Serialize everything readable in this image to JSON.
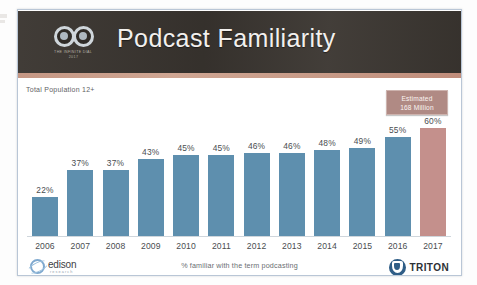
{
  "slide": {
    "title": "Podcast Familiarity",
    "brand": {
      "logo_line1": "THE INFINITE DIAL",
      "logo_line2": "2017"
    },
    "population_note": "Total Population 12+",
    "callout": {
      "line1": "Estimated",
      "line2": "168 Million"
    },
    "footer": {
      "caption": "% familiar with the term podcasting",
      "copyright": "The Infinite Dial  © 2017 Edison Research and Triton Digital",
      "edison_word": "edison",
      "edison_sub": "research",
      "triton_word": "TRITON"
    }
  },
  "colors": {
    "header_background": "#3b3631",
    "header_stripe": "#c79a87",
    "bar_primary": "#5e8fae",
    "bar_accent": "#c4908c",
    "callout_background": "#b08a84",
    "slide_background": "#ffffff",
    "axis_line": "#cfd6dc"
  },
  "chart_data": {
    "type": "bar",
    "title": "Podcast Familiarity",
    "subtitle": "Total Population 12+",
    "xlabel": "",
    "ylabel": "",
    "ylim": [
      0,
      65
    ],
    "grid": false,
    "legend": "none",
    "annotation": "Estimated 168 Million",
    "value_suffix": "%",
    "categories": [
      "2006",
      "2007",
      "2008",
      "2009",
      "2010",
      "2011",
      "2012",
      "2013",
      "2014",
      "2015",
      "2016",
      "2017"
    ],
    "values": [
      22,
      37,
      37,
      43,
      45,
      45,
      46,
      46,
      48,
      49,
      55,
      60
    ],
    "value_labels": [
      "22%",
      "37%",
      "37%",
      "43%",
      "45%",
      "45%",
      "46%",
      "46%",
      "48%",
      "49%",
      "55%",
      "60%"
    ],
    "bar_colors": [
      "#5e8fae",
      "#5e8fae",
      "#5e8fae",
      "#5e8fae",
      "#5e8fae",
      "#5e8fae",
      "#5e8fae",
      "#5e8fae",
      "#5e8fae",
      "#5e8fae",
      "#5e8fae",
      "#c4908c"
    ],
    "footnote": "% familiar with the term podcasting"
  }
}
